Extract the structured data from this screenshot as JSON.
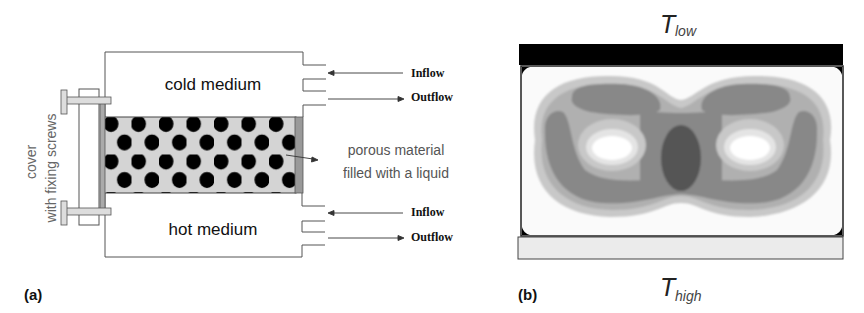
{
  "panel_a": {
    "label": "(a)",
    "top_chamber": "cold medium",
    "bottom_chamber": "hot medium",
    "porous_label_line1": "porous material",
    "porous_label_line2": "filled with a liquid",
    "cover_label_line1": "cover",
    "cover_label_line2": "with fixing screws",
    "top_inflow": "Inflow",
    "top_outflow": "Outflow",
    "bottom_inflow": "Inflow",
    "bottom_outflow": "Outflow"
  },
  "panel_b": {
    "label": "(b)",
    "top_T": "T",
    "top_sub": "low",
    "bottom_T": "T",
    "bottom_sub": "high"
  },
  "colors": {
    "hot_plate": "#ebebeb",
    "cold_plate": "#000000",
    "porous_bg": "#d4d4d4",
    "pore": "#000000"
  }
}
